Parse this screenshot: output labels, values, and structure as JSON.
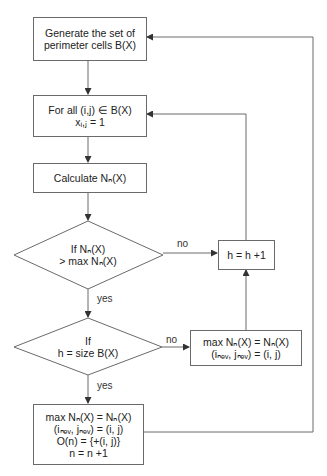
{
  "diagram": {
    "type": "flowchart",
    "nodes": {
      "generate": {
        "lines": [
          "Generate the set of",
          "perimeter cells B(X)"
        ]
      },
      "for_all": {
        "lines": [
          "For all (i,j) ∈ B(X)",
          "xᵢ,ⱼ = 1"
        ]
      },
      "calculate": {
        "lines": [
          "Calculate Nₙ(X)"
        ]
      },
      "decision1": {
        "lines": [
          "If Nₙ(X)",
          "> max Nₙ(X)"
        ]
      },
      "increment_h": {
        "lines": [
          "h = h +1"
        ]
      },
      "decision2": {
        "lines": [
          "If",
          "h = size B(X)"
        ]
      },
      "update_max": {
        "lines": [
          "max Nₙ(X) = Nₙ(X)",
          "(iₙₑᵥ, jₙₑᵥ) = (i, j)"
        ]
      },
      "final": {
        "lines": [
          "max Nₙ(X) = Nₙ(X)",
          "(iₙₑᵥ, jₙₑᵥ) = (i, j)",
          "O(n) = {+(i, j)}",
          "n = n +1"
        ]
      }
    },
    "edge_labels": {
      "d1_no": "no",
      "d1_yes": "yes",
      "d2_no": "no",
      "d2_yes": "yes"
    },
    "colors": {
      "stroke": "#6a6a6a",
      "text": "#222222",
      "background": "#ffffff"
    }
  }
}
